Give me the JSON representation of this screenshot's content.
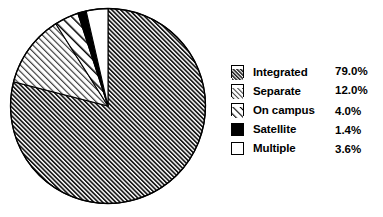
{
  "chart_data": {
    "type": "pie",
    "title": "",
    "subtitle": "",
    "xlabel": "",
    "ylabel": "",
    "categories": [
      "Integrated",
      "Separate",
      "On campus",
      "Satellite",
      "Multiple"
    ],
    "values": [
      79.0,
      12.0,
      4.0,
      1.4,
      3.6
    ],
    "value_labels": [
      "79.0%",
      "12.0%",
      "4.0%",
      "1.4%",
      "3.6%"
    ],
    "units": "percent",
    "total": 100.0,
    "start_angle_deg": 0,
    "direction": "clockwise",
    "legend_position": "right",
    "grid": false,
    "slices": [
      {
        "label": "Integrated",
        "value": 79.0,
        "value_label": "79.0%",
        "pattern": "dense-diagonal-hatch",
        "fill": "#ffffff",
        "line_color": "#000000",
        "start_deg": 0,
        "end_deg": 284.4
      },
      {
        "label": "Separate",
        "value": 12.0,
        "value_label": "12.0%",
        "pattern": "light-diagonal-hatch",
        "fill": "#ffffff",
        "line_color": "#000000",
        "start_deg": 284.4,
        "end_deg": 327.6
      },
      {
        "label": "On campus",
        "value": 4.0,
        "value_label": "4.0%",
        "pattern": "sparse-diagonal-hatch",
        "fill": "#ffffff",
        "line_color": "#000000",
        "start_deg": 327.6,
        "end_deg": 342.0
      },
      {
        "label": "Satellite",
        "value": 1.4,
        "value_label": "1.4%",
        "pattern": "solid-black",
        "fill": "#000000",
        "line_color": "#000000",
        "start_deg": 342.0,
        "end_deg": 347.04
      },
      {
        "label": "Multiple",
        "value": 3.6,
        "value_label": "3.6%",
        "pattern": "blank-white",
        "fill": "#ffffff",
        "line_color": "#000000",
        "start_deg": 347.04,
        "end_deg": 360.0
      }
    ]
  },
  "legend": {
    "items": [
      {
        "label": "Integrated",
        "value": "79.0%",
        "swatch": "dense-diagonal-hatch-swatch"
      },
      {
        "label": "Separate",
        "value": "12.0%",
        "swatch": "light-diagonal-hatch-swatch"
      },
      {
        "label": "On campus",
        "value": "4.0%",
        "swatch": "sparse-diagonal-hatch-swatch"
      },
      {
        "label": "Satellite",
        "value": "1.4%",
        "swatch": "solid-black-swatch"
      },
      {
        "label": "Multiple",
        "value": "3.6%",
        "swatch": "blank-white-swatch"
      }
    ]
  },
  "colors": {
    "background": "#ffffff",
    "ink": "#000000",
    "outline": "#000000"
  }
}
